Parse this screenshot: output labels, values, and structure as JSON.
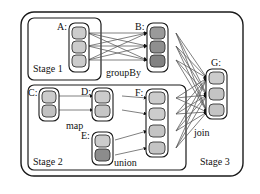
{
  "diagram": {
    "colors": {
      "stroke": "#1a1a1a",
      "edge": "#555555",
      "node_light": "#cccccc",
      "node_mid": "#b0b0b0",
      "node_dark": "#8c8c8c",
      "background": "#ffffff"
    },
    "stages": [
      {
        "id": "stage1",
        "label": "Stage 1"
      },
      {
        "id": "stage2",
        "label": "Stage 2"
      },
      {
        "id": "stage3",
        "label": "Stage 3"
      }
    ],
    "rdd_groups": [
      {
        "id": "A",
        "label": "A:",
        "partitions": 3,
        "shade": "light"
      },
      {
        "id": "B",
        "label": "B:",
        "partitions": 3,
        "shade": "dark"
      },
      {
        "id": "C",
        "label": "C:",
        "partitions": 2,
        "shade": "light"
      },
      {
        "id": "D",
        "label": "D:",
        "partitions": 2,
        "shade": "light"
      },
      {
        "id": "E",
        "label": "E:",
        "partitions": 2,
        "shade": "mixed"
      },
      {
        "id": "F",
        "label": "F:",
        "partitions": 4,
        "shade": "light"
      },
      {
        "id": "G",
        "label": "G:",
        "partitions": 3,
        "shade": "light"
      }
    ],
    "operations": [
      {
        "id": "groupBy",
        "label": "groupBy",
        "from": "A",
        "to": "B"
      },
      {
        "id": "map",
        "label": "map",
        "from": "C",
        "to": "D"
      },
      {
        "id": "union",
        "label": "union",
        "from": "E",
        "to": "F"
      },
      {
        "id": "join",
        "label": "join",
        "from": "B,F",
        "to": "G"
      }
    ]
  }
}
